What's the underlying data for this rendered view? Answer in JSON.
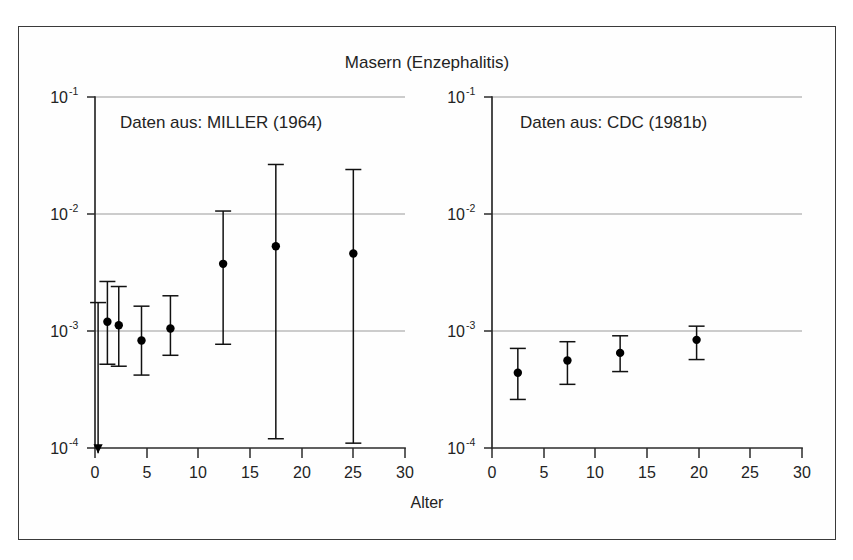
{
  "figure": {
    "title": "Masern (Enzephalitis)",
    "xlabel": "Alter",
    "ylabel": "",
    "border_color": "#3a3a3a",
    "background": "#ffffff",
    "marker_color": "#000000",
    "grid_color": "#9a9a9a"
  },
  "panels": [
    {
      "id": "left",
      "label": "Daten aus: MILLER (1964)",
      "source": "MILLER (1964)"
    },
    {
      "id": "right",
      "label": "Daten aus: CDC (1981b)",
      "source": "CDC (1981b)"
    }
  ],
  "axes": {
    "x": {
      "ticks": [
        0,
        5,
        10,
        15,
        20,
        25,
        30
      ],
      "tick_labels": [
        "0",
        "5",
        "10",
        "15",
        "20",
        "25",
        "30"
      ],
      "min": 0,
      "max": 30,
      "label": "Alter"
    },
    "y": {
      "scale": "log",
      "ticks": [
        0.1,
        0.01,
        0.001,
        0.0001
      ],
      "tick_labels": [
        "10",
        "10",
        "10",
        "10"
      ],
      "tick_exponents": [
        "-1",
        "-2",
        "-3",
        "-4"
      ],
      "min": 0.0001,
      "max": 0.1,
      "grid": true
    }
  },
  "chart_data": {
    "type": "scatter",
    "title": "Masern (Enzephalitis)",
    "xlabel": "Alter",
    "ylabel": "",
    "yscale": "log",
    "xlim": [
      0,
      30
    ],
    "ylim": [
      0.0001,
      0.1
    ],
    "grid": true,
    "legend_position": "inside-top-left",
    "panels": [
      {
        "name": "Daten aus: MILLER (1964)",
        "marker": "filled-circle",
        "error_style": "capped-vertical",
        "points": [
          {
            "x": 0.3,
            "y": 9e-05,
            "ylow": 9e-05,
            "yhigh": 0.00175,
            "lower_is_arrow": true
          },
          {
            "x": 1.2,
            "y": 0.0012,
            "ylow": 0.00052,
            "yhigh": 0.00265
          },
          {
            "x": 2.3,
            "y": 0.00112,
            "ylow": 0.0005,
            "yhigh": 0.0024
          },
          {
            "x": 4.5,
            "y": 0.00083,
            "ylow": 0.00042,
            "yhigh": 0.00163
          },
          {
            "x": 7.3,
            "y": 0.00105,
            "ylow": 0.00062,
            "yhigh": 0.002
          },
          {
            "x": 12.4,
            "y": 0.00375,
            "ylow": 0.00077,
            "yhigh": 0.0106
          },
          {
            "x": 17.5,
            "y": 0.0053,
            "ylow": 0.00012,
            "yhigh": 0.0265
          },
          {
            "x": 25.0,
            "y": 0.0046,
            "ylow": 0.00011,
            "yhigh": 0.024
          }
        ]
      },
      {
        "name": "Daten aus: CDC (1981b)",
        "marker": "filled-circle",
        "error_style": "capped-vertical",
        "points": [
          {
            "x": 2.5,
            "y": 0.00044,
            "ylow": 0.00026,
            "yhigh": 0.00071
          },
          {
            "x": 7.3,
            "y": 0.00056,
            "ylow": 0.00035,
            "yhigh": 0.00081
          },
          {
            "x": 12.4,
            "y": 0.00065,
            "ylow": 0.00045,
            "yhigh": 0.00091
          },
          {
            "x": 19.8,
            "y": 0.00084,
            "ylow": 0.00057,
            "yhigh": 0.0011
          }
        ]
      }
    ]
  }
}
